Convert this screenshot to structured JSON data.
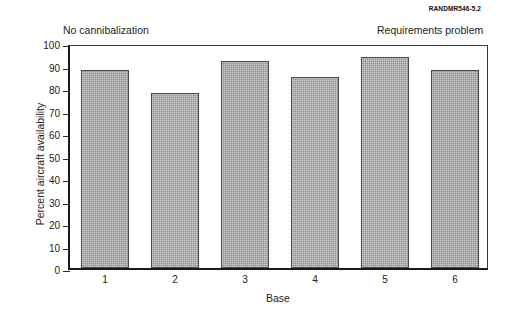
{
  "source_tag": {
    "prefix": "RAND",
    "full": "RANDMR546-5.2"
  },
  "annotations": {
    "left": "No cannibalization",
    "right": "Requirements problem"
  },
  "chart_data": {
    "type": "bar",
    "title": "",
    "categories": [
      "1",
      "2",
      "3",
      "4",
      "5",
      "6"
    ],
    "values": [
      88,
      78,
      92,
      85,
      94,
      88
    ],
    "xlabel": "Base",
    "ylabel": "Percent aircraft availability",
    "ylim": [
      0,
      100
    ],
    "yticks": [
      0,
      10,
      20,
      30,
      40,
      50,
      60,
      70,
      80,
      90,
      100
    ],
    "ytick_labels": [
      "0",
      "10",
      "20",
      "30",
      "40",
      "50",
      "60",
      "70",
      "80",
      "90",
      "100"
    ],
    "grid": false,
    "legend": null,
    "bar_color": "#8f8f8f",
    "bar_edge_color": "#4a4a4a",
    "axis_color": "#1a1a1a",
    "annotations": [
      {
        "text": "No cannibalization",
        "position": "top-left"
      },
      {
        "text": "Requirements problem",
        "position": "top-right"
      }
    ]
  }
}
